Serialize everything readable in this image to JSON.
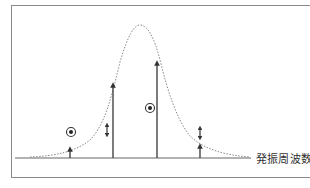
{
  "axis": {
    "x_label": "発振周波数"
  },
  "colors": {
    "frame": "#8a8a8a",
    "curve": "#888888",
    "arrows": "#444444",
    "baseline": "#666666"
  },
  "elements": {
    "curve": "dotted bell-shaped resonance curve peaking near center",
    "vertical_arrows": [
      {
        "x": 70,
        "tip_y": 148
      },
      {
        "x": 113,
        "tip_y": 84
      },
      {
        "x": 157,
        "tip_y": 62
      },
      {
        "x": 200,
        "tip_y": 145
      }
    ],
    "circled_dots": [
      {
        "x": 71,
        "y": 132
      },
      {
        "x": 150,
        "y": 108
      }
    ],
    "double_arrows": [
      {
        "x": 107,
        "y": 130
      },
      {
        "x": 200,
        "y": 133
      }
    ]
  }
}
